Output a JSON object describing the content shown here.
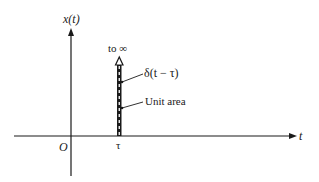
{
  "diagram": {
    "y_axis_label": "x(t)",
    "x_axis_label": "t",
    "origin_label": "O",
    "tau_label": "τ",
    "infinity_label": "to ∞",
    "impulse_label": "δ(t − τ)",
    "area_label": "Unit area",
    "colors": {
      "line": "#1a1a1a",
      "background": "#ffffff"
    }
  }
}
